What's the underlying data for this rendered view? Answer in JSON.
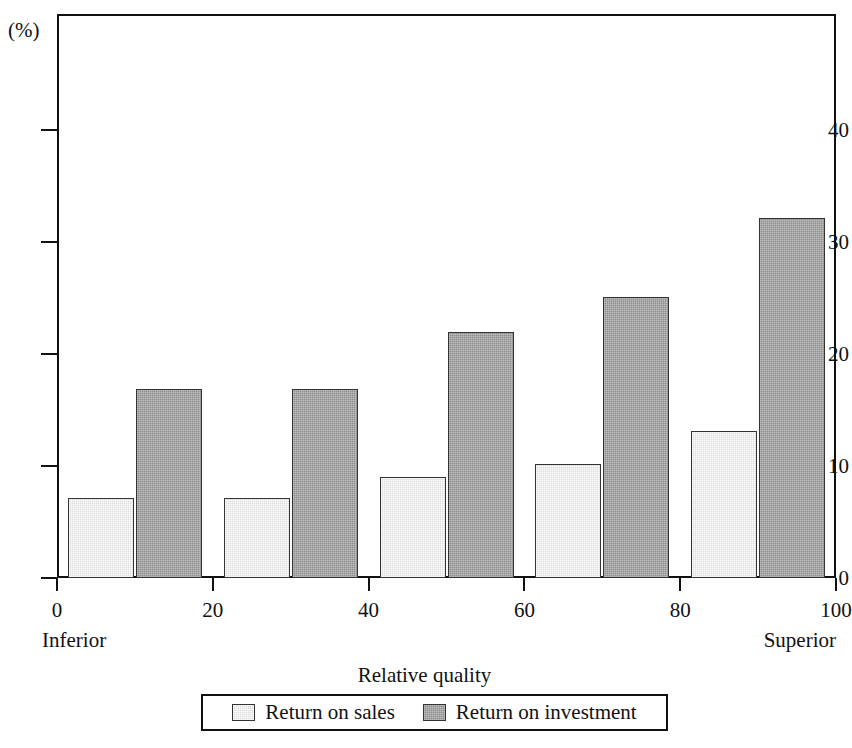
{
  "chart_data": {
    "type": "bar",
    "title": "",
    "xlabel": "Relative quality",
    "ylabel": "(%)",
    "ylim": [
      0,
      47
    ],
    "xlim": [
      0,
      100
    ],
    "grid": false,
    "legend_position": "bottom",
    "y_unit_label": "(%)",
    "y_ticks": [
      0,
      10,
      20,
      30,
      40
    ],
    "y_tick_labels": [
      "0",
      "10",
      "20",
      "30",
      "40"
    ],
    "x_ticks": [
      0,
      20,
      40,
      60,
      80,
      100
    ],
    "x_tick_labels": [
      "0",
      "20",
      "40",
      "60",
      "80",
      "100"
    ],
    "x_axis_left_caption": "Inferior",
    "x_axis_right_caption": "Superior",
    "categories": [
      "Quintile 1",
      "Quintile 2",
      "Quintile 3",
      "Quintile 4",
      "Quintile 5"
    ],
    "group_centers_x": [
      10,
      30,
      50,
      70,
      90
    ],
    "series": [
      {
        "name": "Return on sales",
        "color": "#dedede",
        "values": [
          7.1,
          7.1,
          9.0,
          10.2,
          13.1
        ]
      },
      {
        "name": "Return on investment",
        "color": "#8f8f8f",
        "values": [
          16.9,
          16.9,
          22.0,
          25.1,
          32.1
        ]
      }
    ]
  },
  "legend": {
    "entries": [
      {
        "label": "Return on sales",
        "swatch": "light-gray-swatch"
      },
      {
        "label": "Return on investment",
        "swatch": "dark-gray-swatch"
      }
    ]
  }
}
